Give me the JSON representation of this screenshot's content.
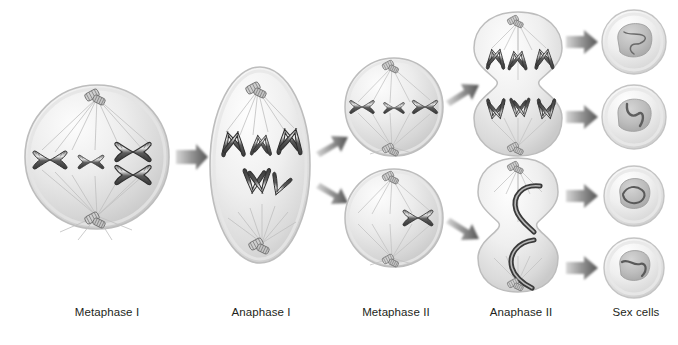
{
  "figure": {
    "background_color": "#ffffff",
    "width": 678,
    "height": 345
  },
  "palette": {
    "cell_fill_light": "#f2f2f2",
    "cell_fill_mid": "#d9d9d9",
    "cell_edge": "#bdbdbd",
    "chromosome_dark": "#4a4a4a",
    "chromosome_outline": "#2b2b2b",
    "spindle_line": "#c8c8c8",
    "centrosome": "#8c8c8c",
    "arrow_fill": "#6e6e6e",
    "label_color": "#231f20",
    "nucleus_fill": "#bfbfbf"
  },
  "labels": [
    {
      "id": "metaphase-i",
      "text": "Metaphase I",
      "x": 107
    },
    {
      "id": "anaphase-i",
      "text": "Anaphase I",
      "x": 261
    },
    {
      "id": "metaphase-ii",
      "text": "Metaphase II",
      "x": 396
    },
    {
      "id": "anaphase-ii",
      "text": "Anaphase II",
      "x": 521
    },
    {
      "id": "sex-cells",
      "text": "Sex cells",
      "x": 636
    }
  ],
  "cells": [
    {
      "id": "metaphase-i-cell",
      "stage": "Metaphase I",
      "shape": "circle",
      "cx": 97,
      "cy": 157,
      "rx": 72,
      "ry": 72,
      "chromosome_count": 3,
      "description": "Homologous chromosome pairs aligned at the cell equator with spindle fibers from both poles"
    },
    {
      "id": "anaphase-i-cell",
      "stage": "Anaphase I",
      "shape": "ellipse",
      "cx": 260,
      "cy": 165,
      "rx": 50,
      "ry": 98,
      "chromosome_count": 4,
      "description": "Elongated cell with homologous chromosomes pulled toward opposite poles"
    },
    {
      "id": "metaphase-ii-cell-top",
      "stage": "Metaphase II",
      "shape": "circle",
      "cx": 394,
      "cy": 107,
      "rx": 49,
      "ry": 49,
      "chromosome_count": 3,
      "description": "Upper daughter cell with sister chromatids aligned at equator"
    },
    {
      "id": "metaphase-ii-cell-bottom",
      "stage": "Metaphase II",
      "shape": "circle",
      "cx": 394,
      "cy": 218,
      "rx": 49,
      "ry": 49,
      "chromosome_count": 1,
      "description": "Lower daughter cell with sister chromatids aligned at equator"
    },
    {
      "id": "anaphase-ii-cell-top",
      "stage": "Anaphase II",
      "shape": "dumbbell",
      "cx": 518,
      "cy": 84,
      "rx": 40,
      "ry": 72,
      "chromosome_count": 6,
      "description": "Upper cell pinching into two, sister chromatids separating to poles"
    },
    {
      "id": "anaphase-ii-cell-bottom",
      "stage": "Anaphase II",
      "shape": "dumbbell",
      "cx": 518,
      "cy": 222,
      "rx": 38,
      "ry": 66,
      "chromosome_count": 2,
      "description": "Lower cell pinching into two, sister chromatids separating to poles"
    },
    {
      "id": "sex-cell-1",
      "stage": "Sex cells",
      "shape": "circle",
      "cx": 634,
      "cy": 42,
      "rx": 32,
      "ry": 32,
      "chromosome_count": 1,
      "description": "Haploid gamete with nucleus containing chromatin"
    },
    {
      "id": "sex-cell-2",
      "stage": "Sex cells",
      "shape": "circle",
      "cx": 634,
      "cy": 117,
      "rx": 32,
      "ry": 32,
      "chromosome_count": 1,
      "description": "Haploid gamete with nucleus containing chromatin"
    },
    {
      "id": "sex-cell-3",
      "stage": "Sex cells",
      "shape": "circle",
      "cx": 634,
      "cy": 196,
      "rx": 30,
      "ry": 30,
      "chromosome_count": 1,
      "description": "Haploid gamete with nucleus containing chromatin"
    },
    {
      "id": "sex-cell-4",
      "stage": "Sex cells",
      "shape": "circle",
      "cx": 634,
      "cy": 268,
      "rx": 30,
      "ry": 30,
      "chromosome_count": 1,
      "description": "Haploid gamete with nucleus containing chromatin"
    }
  ],
  "arrows": [
    {
      "id": "arrow-metaphase-i-to-anaphase-i",
      "from": "metaphase-i-cell",
      "to": "anaphase-i-cell",
      "x1": 172,
      "y1": 157,
      "x2": 205,
      "y2": 157
    },
    {
      "id": "arrow-anaphase-i-to-metaphase-ii-top",
      "from": "anaphase-i-cell",
      "to": "metaphase-ii-cell-top",
      "x1": 313,
      "y1": 143,
      "x2": 344,
      "y2": 125
    },
    {
      "id": "arrow-anaphase-i-to-metaphase-ii-bottom",
      "from": "anaphase-i-cell",
      "to": "metaphase-ii-cell-bottom",
      "x1": 313,
      "y1": 195,
      "x2": 344,
      "y2": 212
    },
    {
      "id": "arrow-metaphase-ii-top-to-anaphase-ii-top",
      "from": "metaphase-ii-cell-top",
      "to": "anaphase-ii-cell-top",
      "x1": 446,
      "y1": 96,
      "x2": 480,
      "y2": 76
    },
    {
      "id": "arrow-metaphase-ii-bottom-to-anaphase-ii-bottom",
      "from": "metaphase-ii-cell-bottom",
      "to": "anaphase-ii-cell-bottom",
      "x1": 446,
      "y1": 228,
      "x2": 480,
      "y2": 248
    },
    {
      "id": "arrow-anaphase-ii-top-to-sex-cell-1",
      "from": "anaphase-ii-cell-top",
      "to": "sex-cell-1",
      "x1": 565,
      "y1": 42,
      "x2": 598,
      "y2": 42
    },
    {
      "id": "arrow-anaphase-ii-top-to-sex-cell-2",
      "from": "anaphase-ii-cell-top",
      "to": "sex-cell-2",
      "x1": 565,
      "y1": 117,
      "x2": 598,
      "y2": 117
    },
    {
      "id": "arrow-anaphase-ii-bottom-to-sex-cell-3",
      "from": "anaphase-ii-cell-bottom",
      "to": "sex-cell-3",
      "x1": 565,
      "y1": 196,
      "x2": 598,
      "y2": 196
    },
    {
      "id": "arrow-anaphase-ii-bottom-to-sex-cell-4",
      "from": "anaphase-ii-cell-bottom",
      "to": "sex-cell-4",
      "x1": 565,
      "y1": 268,
      "x2": 598,
      "y2": 268
    }
  ]
}
